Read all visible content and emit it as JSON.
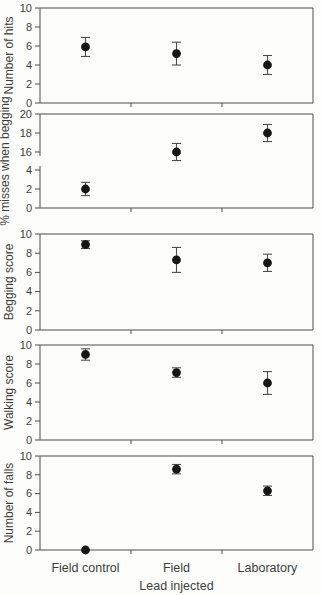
{
  "chart_data": {
    "type": "scatter",
    "title": "",
    "xlabel": "Lead injected",
    "categories": [
      "Field control",
      "Field",
      "Laboratory"
    ],
    "marker": "filled-circle",
    "error_bars": true,
    "grid": false,
    "legend": "none",
    "panels": [
      {
        "ylabel": "Number of hits",
        "ylim": [
          0,
          10
        ],
        "yticks": [
          0,
          2,
          4,
          6,
          8,
          10
        ],
        "values": [
          5.9,
          5.2,
          4.0
        ],
        "errors": [
          1.0,
          1.2,
          1.0
        ]
      },
      {
        "ylabel": "% misses when begging",
        "axis_break": true,
        "segments": [
          {
            "ylim": [
              0,
              4
            ],
            "yticks": [
              0,
              2,
              4
            ]
          },
          {
            "ylim": [
              16,
              20
            ],
            "yticks": [
              16,
              18,
              20
            ]
          }
        ],
        "values": [
          2.0,
          16.0,
          18.0
        ],
        "errors": [
          0.7,
          0.9,
          0.9
        ]
      },
      {
        "ylabel": "Begging score",
        "ylim": [
          0,
          10
        ],
        "yticks": [
          0,
          2,
          4,
          6,
          8,
          10
        ],
        "values": [
          8.9,
          7.3,
          7.0
        ],
        "errors": [
          0.4,
          1.3,
          0.9
        ]
      },
      {
        "ylabel": "Walking score",
        "ylim": [
          0,
          10
        ],
        "yticks": [
          0,
          2,
          4,
          6,
          8,
          10
        ],
        "values": [
          9.0,
          7.1,
          6.0
        ],
        "errors": [
          0.6,
          0.5,
          1.2
        ]
      },
      {
        "ylabel": "Number of falls",
        "ylim": [
          0,
          10
        ],
        "yticks": [
          0,
          2,
          4,
          6,
          8,
          10
        ],
        "values": [
          0.0,
          8.6,
          6.3
        ],
        "errors": [
          0.0,
          0.5,
          0.5
        ]
      }
    ]
  },
  "colors": {
    "axis": "#4d4d4d",
    "text": "#3d3d3d",
    "marker": "#161616",
    "background": "#fdfdfb"
  }
}
